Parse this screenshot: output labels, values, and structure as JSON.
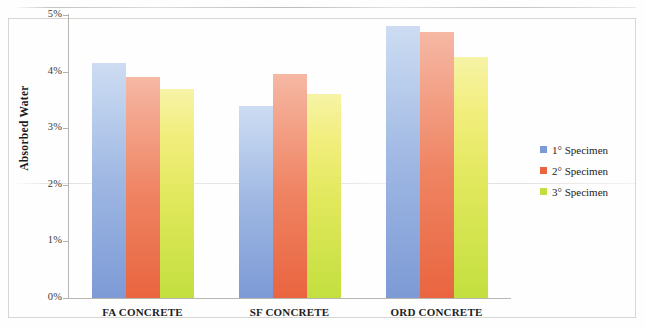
{
  "chart_data": {
    "type": "bar",
    "title": "",
    "xlabel": "",
    "ylabel": "Absorbed Water",
    "categories": [
      "FA CONCRETE",
      "SF CONCRETE",
      "ORD CONCRETE"
    ],
    "series": [
      {
        "name": "1° Specimen",
        "color": "#7d9ad6",
        "values": [
          4.15,
          3.4,
          4.8
        ]
      },
      {
        "name": "2° Specimen",
        "color": "#e9653f",
        "values": [
          3.9,
          3.95,
          4.7
        ]
      },
      {
        "name": "3° Specimen",
        "color": "#c3df3f",
        "values": [
          3.7,
          3.6,
          4.25
        ]
      }
    ],
    "ylim": [
      0,
      5
    ],
    "ytick_labels": [
      "0%",
      "1%",
      "2%",
      "3%",
      "4%",
      "5%"
    ],
    "ytick_values": [
      0,
      1,
      2,
      3,
      4,
      5
    ],
    "grid": false,
    "legend_position": "right"
  },
  "axis": {
    "y_title": "Absorbed Water"
  }
}
